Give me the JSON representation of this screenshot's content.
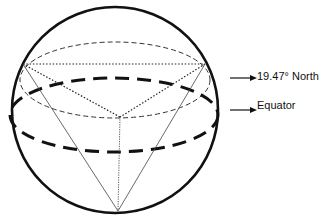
{
  "diagram": {
    "labels": {
      "north": "19.47° North",
      "equator": "Equator"
    },
    "elements": {
      "sphere": "outer circle (sphere outline)",
      "equator": "heavy dashed ellipse",
      "latitude_circle": "thin dashed ellipse at 19.47° North",
      "triangle": "dotted triangle on latitude plane",
      "apex": "south pole vertex of tetrahedron"
    },
    "colors": {
      "stroke": "#111111",
      "background": "#ffffff"
    }
  }
}
